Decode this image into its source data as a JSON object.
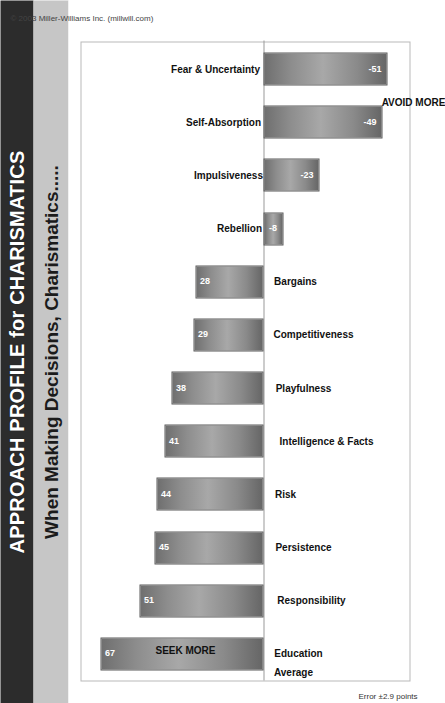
{
  "header": {
    "title": "APPROACH PROFILE for CHARISMATICS",
    "subtitle": "When Making Decisions, Charismatics.....",
    "title_bg": "#2c2c2c",
    "subtitle_bg": "#c6c6c6"
  },
  "footer": {
    "error_note": "Error ±2.9 points",
    "copyright": "© 2003 Miller-Williams Inc. (millwill.com)"
  },
  "chart_data": {
    "type": "bar",
    "title": "APPROACH PROFILE for CHARISMATICS",
    "subtitle": "When Making Decisions, Charismatics.....",
    "xlabel": "",
    "ylabel": "",
    "ylim": [
      -60,
      75
    ],
    "grid": false,
    "legend": null,
    "baseline_label": "Average",
    "positive_direction_label": "SEEK MORE",
    "negative_direction_label": "AVOID MORE",
    "error_margin": "Error ±2.9 points",
    "bar_color": "#8d8d8d",
    "categories": [
      "Education",
      "Responsibility",
      "Persistence",
      "Risk",
      "Intelligence & Facts",
      "Playfulness",
      "Competitiveness",
      "Bargains",
      "Rebellion",
      "Impulsiveness",
      "Self-Absorption",
      "Fear & Uncertainty"
    ],
    "values": [
      67,
      51,
      45,
      44,
      41,
      38,
      29,
      28,
      -8,
      -23,
      -49,
      -51
    ]
  }
}
